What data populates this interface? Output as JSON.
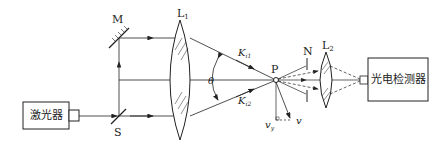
{
  "diagram": {
    "type": "laser-doppler-velocimeter-schematic",
    "components": {
      "laser": {
        "label": "激光器"
      },
      "mirror": {
        "label": "M"
      },
      "splitter": {
        "label": "S"
      },
      "lens1": {
        "label": "L",
        "sub": "1"
      },
      "lens2": {
        "label": "L",
        "sub": "2"
      },
      "aperture": {
        "label": "N"
      },
      "particle": {
        "label": "P"
      },
      "detector": {
        "label": "光电检测器"
      }
    },
    "symbols": {
      "theta": "θ",
      "ki1": {
        "main": "K",
        "sub": "i1"
      },
      "ki2": {
        "main": "K",
        "sub": "i2"
      },
      "v": "v",
      "vy": {
        "main": "v",
        "sub": "y"
      }
    },
    "colors": {
      "line": "#222222",
      "background": "#ffffff"
    }
  }
}
